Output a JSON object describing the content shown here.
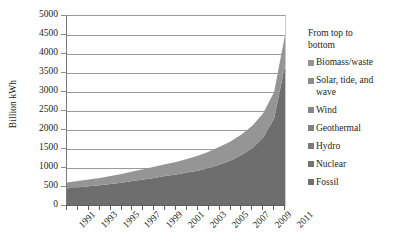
{
  "chart_data": {
    "type": "area",
    "title": "",
    "xlabel": "",
    "ylabel": "Billion kWh",
    "ylim": [
      0,
      5000
    ],
    "ytick_step": 500,
    "grid": true,
    "stacked": true,
    "legend_position": "right",
    "legend_heading": "From top to bottom",
    "y_ticks": [
      "0",
      "500",
      "1000",
      "1500",
      "2000",
      "2500",
      "3000",
      "3500",
      "4000",
      "4500",
      "5000"
    ],
    "x": [
      1991,
      1992,
      1993,
      1994,
      1995,
      1996,
      1997,
      1998,
      1999,
      2000,
      2001,
      2002,
      2003,
      2004,
      2005,
      2006,
      2007,
      2008,
      2009,
      2010,
      2011
    ],
    "x_tick_labels": [
      "1991",
      "1993",
      "1995",
      "1997",
      "1999",
      "2001",
      "2003",
      "2005",
      "2007",
      "2009",
      "2011"
    ],
    "series": [
      {
        "name": "Fossil",
        "color": "#6e6e6e",
        "values": [
          470,
          490,
          520,
          545,
          580,
          615,
          660,
          700,
          740,
          790,
          830,
          880,
          930,
          1000,
          1090,
          1200,
          1340,
          1520,
          1800,
          2300,
          3700
        ]
      },
      {
        "name": "Nuclear",
        "color": "#747474",
        "values": [
          0,
          0,
          0,
          0,
          0,
          0,
          0,
          0,
          0,
          0,
          0,
          0,
          0,
          0,
          0,
          0,
          0,
          0,
          0,
          0,
          0
        ]
      },
      {
        "name": "Hydro",
        "color": "#7a7a7a",
        "values": [
          0,
          0,
          0,
          0,
          0,
          0,
          0,
          0,
          0,
          0,
          0,
          0,
          0,
          0,
          0,
          0,
          0,
          0,
          0,
          0,
          0
        ]
      },
      {
        "name": "Geothermal",
        "color": "#808080",
        "values": [
          0,
          0,
          0,
          0,
          0,
          0,
          0,
          0,
          0,
          0,
          0,
          0,
          0,
          0,
          0,
          0,
          0,
          0,
          0,
          0,
          0
        ]
      },
      {
        "name": "Wind",
        "color": "#868686",
        "values": [
          0,
          0,
          0,
          0,
          0,
          0,
          0,
          0,
          0,
          0,
          0,
          0,
          0,
          0,
          0,
          0,
          0,
          0,
          0,
          0,
          0
        ]
      },
      {
        "name": "Solar, tide, and wave",
        "color": "#8c8c8c",
        "values": [
          0,
          0,
          0,
          0,
          0,
          0,
          0,
          0,
          0,
          0,
          0,
          0,
          0,
          0,
          0,
          0,
          0,
          0,
          0,
          0,
          0
        ]
      },
      {
        "name": "Biomass/waste",
        "color": "#959595",
        "values": [
          150,
          165,
          180,
          195,
          210,
          230,
          250,
          270,
          290,
          310,
          330,
          355,
          390,
          430,
          470,
          500,
          540,
          590,
          640,
          700,
          800
        ]
      }
    ],
    "totals": [
      620,
      655,
      700,
      740,
      790,
      845,
      910,
      970,
      1030,
      1100,
      1160,
      1235,
      1320,
      1430,
      1560,
      1700,
      1880,
      2110,
      2440,
      3000,
      4500
    ]
  },
  "legend": {
    "heading": "From top to bottom",
    "items": [
      {
        "label": "Biomass/waste",
        "color": "#959595"
      },
      {
        "label": "Solar, tide, and wave",
        "color": "#8c8c8c"
      },
      {
        "label": "Wind",
        "color": "#868686"
      },
      {
        "label": "Geothermal",
        "color": "#808080"
      },
      {
        "label": "Hydro",
        "color": "#7a7a7a"
      },
      {
        "label": "Nuclear",
        "color": "#747474"
      },
      {
        "label": "Fossil",
        "color": "#6e6e6e"
      }
    ]
  },
  "axes": {
    "y_title": "Billion kWh"
  }
}
